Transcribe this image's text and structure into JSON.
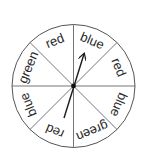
{
  "diagram": {
    "type": "spinner",
    "section_count": 8,
    "center": {
      "x": 73.5,
      "y": 86
    },
    "radius": 61.5,
    "line_color": "#555555",
    "text_color": "#2a2a2a",
    "sections": [
      {
        "index": 0,
        "start_deg": 0,
        "end_deg": 45,
        "label": "blue"
      },
      {
        "index": 1,
        "start_deg": 45,
        "end_deg": 90,
        "label": "red"
      },
      {
        "index": 2,
        "start_deg": 90,
        "end_deg": 135,
        "label": "blue"
      },
      {
        "index": 3,
        "start_deg": 135,
        "end_deg": 180,
        "label": "green"
      },
      {
        "index": 4,
        "start_deg": 180,
        "end_deg": 225,
        "label": "red"
      },
      {
        "index": 5,
        "start_deg": 225,
        "end_deg": 270,
        "label": "blue"
      },
      {
        "index": 6,
        "start_deg": 270,
        "end_deg": 315,
        "label": "green"
      },
      {
        "index": 7,
        "start_deg": 315,
        "end_deg": 360,
        "label": "red"
      }
    ],
    "arrow": {
      "pointing_to_section": 0,
      "pointing_label": "blue",
      "tip": {
        "x": 84,
        "y": 54
      },
      "tail": {
        "x": 64,
        "y": 118
      }
    }
  }
}
